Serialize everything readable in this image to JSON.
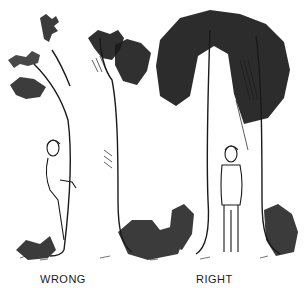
{
  "illustration": {
    "description": "Pen-and-ink drawing of two trees; a person peeks from behind the left tree and a person stands in front of the right tree",
    "captions": {
      "left": "WRONG",
      "right": "RIGHT"
    },
    "colors": {
      "ink": "#1a1a1a",
      "paper": "#ffffff"
    }
  }
}
